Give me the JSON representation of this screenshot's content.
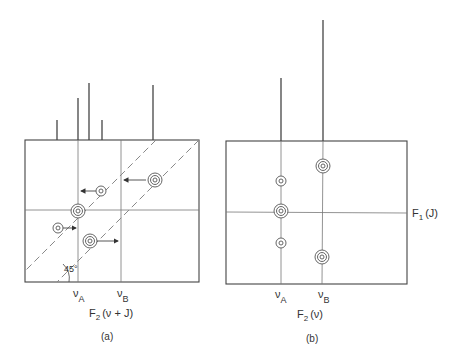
{
  "panel_a": {
    "caption": "(a)",
    "x_axis_label_main": "F",
    "x_axis_label_sub": "2",
    "x_axis_label_rest": "(ν + J)",
    "tick_a_main": "ν",
    "tick_a_sub": "A",
    "tick_b_main": "ν",
    "tick_b_sub": "B",
    "angle_label": "45°",
    "spectrum_peaks": [
      {
        "x": 57,
        "top": 120
      },
      {
        "x": 78,
        "top": 98
      },
      {
        "x": 89,
        "top": 83
      },
      {
        "x": 102,
        "top": 120
      },
      {
        "x": 153,
        "top": 85
      }
    ],
    "cross_peaks": [
      {
        "x": 155,
        "y": 180,
        "size": "large"
      },
      {
        "x": 101,
        "y": 191,
        "size": "small"
      },
      {
        "x": 78,
        "y": 211,
        "size": "large"
      },
      {
        "x": 58,
        "y": 228,
        "size": "small"
      },
      {
        "x": 90,
        "y": 241,
        "size": "large"
      }
    ]
  },
  "panel_b": {
    "caption": "(b)",
    "x_axis_label_main": "F",
    "x_axis_label_sub": "2",
    "x_axis_label_rest": "(ν)",
    "y_axis_label_main": "F",
    "y_axis_label_sub": "1",
    "y_axis_label_rest": "(J)",
    "tick_a_main": "ν",
    "tick_a_sub": "A",
    "tick_b_main": "ν",
    "tick_b_sub": "B",
    "spectrum_peaks": [
      {
        "x": 281,
        "top": 78
      },
      {
        "x": 323,
        "top": 20
      }
    ],
    "cross_peaks": [
      {
        "x": 323,
        "y": 166,
        "size": "large"
      },
      {
        "x": 281,
        "y": 181,
        "size": "small"
      },
      {
        "x": 281,
        "y": 211,
        "size": "large"
      },
      {
        "x": 281,
        "y": 243,
        "size": "small"
      },
      {
        "x": 322,
        "y": 257,
        "size": "large"
      }
    ]
  }
}
